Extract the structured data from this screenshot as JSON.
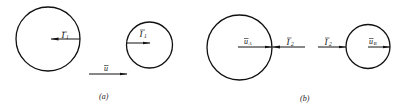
{
  "figure": {
    "panels": [
      {
        "id": "a",
        "caption": "(a)",
        "circles": [
          {
            "name": "large-sphere",
            "cx": 48,
            "cy": 39,
            "r": 32,
            "vector_label": "I",
            "vector_subscript": "1",
            "vector_direction": "left"
          },
          {
            "name": "small-sphere",
            "cx": 149.5,
            "cy": 45,
            "r": 23,
            "vector_label": "I",
            "vector_subscript": "1",
            "vector_direction": "right"
          }
        ],
        "free_vector": {
          "label": "u",
          "direction": "right"
        }
      },
      {
        "id": "b",
        "caption": "(b)",
        "circles": [
          {
            "name": "large-sphere",
            "cx": 239.5,
            "cy": 47.5,
            "r": 32.5,
            "vector_label": "u",
            "vector_subscript": "A",
            "vector_direction": "right"
          },
          {
            "name": "small-sphere",
            "cx": 368,
            "cy": 46.5,
            "r": 22,
            "vector_label": "u",
            "vector_subscript": "B",
            "vector_direction": "right"
          }
        ],
        "external_vectors": [
          {
            "label": "I",
            "subscript": "2",
            "direction": "left"
          },
          {
            "label": "I",
            "subscript": "2",
            "direction": "right"
          }
        ]
      }
    ],
    "labels": {
      "a_big_I": "I",
      "a_big_I_sub": "1",
      "a_small_I": "I",
      "a_small_I_sub": "1",
      "a_u": "u",
      "b_uA": "u",
      "b_uA_sub": "A",
      "b_I2_left": "I",
      "b_I2_left_sub": "2",
      "b_I2_right": "I",
      "b_I2_right_sub": "2",
      "b_uB": "u",
      "b_uB_sub": "B",
      "caption_a": "(a)",
      "caption_b": "(b)"
    }
  }
}
